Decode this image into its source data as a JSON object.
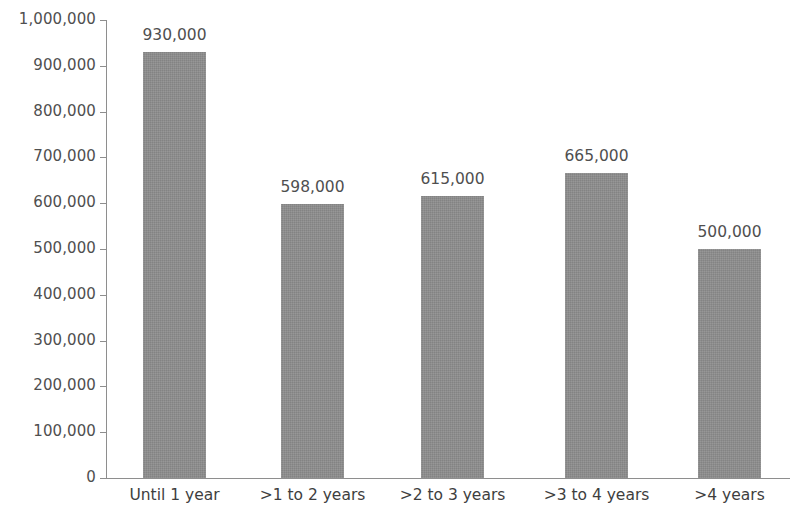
{
  "chart_data": {
    "type": "bar",
    "title": "",
    "subtitle": "",
    "xlabel": "",
    "ylabel": "",
    "categories": [
      "Until 1 year",
      ">1 to 2 years",
      ">2 to 3 years",
      ">3 to 4 years",
      ">4 years"
    ],
    "values": [
      930000,
      598000,
      615000,
      665000,
      500000
    ],
    "value_labels": [
      "930,000",
      "598,000",
      "615,000",
      "665,000",
      "500,000"
    ],
    "ylim": [
      0,
      1000000
    ],
    "ytick_values": [
      0,
      100000,
      200000,
      300000,
      400000,
      500000,
      600000,
      700000,
      800000,
      900000,
      1000000
    ],
    "ytick_labels": [
      "0",
      "100,000",
      "200,000",
      "300,000",
      "400,000",
      "500,000",
      "600,000",
      "700,000",
      "800,000",
      "900,000",
      "1,000,000"
    ],
    "grid": false,
    "legend": null,
    "legend_position": "none",
    "bar_color": "#8c8c8c",
    "axis_color": "#8e8e8e",
    "text_color": "#4f4f4f",
    "background_color": "#ffffff"
  }
}
